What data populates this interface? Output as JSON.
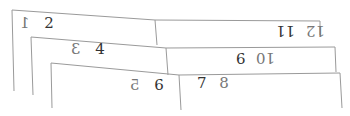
{
  "scene": {
    "description": "Three overlapping sheets of paper, each split into left and right panels, with numbers written in pairs (some mirrored/upside-down)",
    "line_color": "#9a9a9a",
    "text_color": "#333333"
  },
  "sheets": [
    {
      "left": {
        "labels": [
          "1",
          "2"
        ],
        "label_1_mirrored": true
      },
      "right": {
        "labels": [
          "12",
          "11"
        ],
        "orientation": "rotated-180"
      }
    },
    {
      "left": {
        "labels": [
          "3",
          "4"
        ],
        "label_3_mirrored": true
      },
      "right": {
        "labels": [
          "10",
          "9"
        ],
        "orientation": "rotated-180"
      }
    },
    {
      "left": {
        "labels": [
          "5",
          "6"
        ],
        "label_5_mirrored": true
      },
      "right": {
        "labels": [
          "7",
          "8"
        ],
        "orientation": "normal"
      }
    }
  ]
}
